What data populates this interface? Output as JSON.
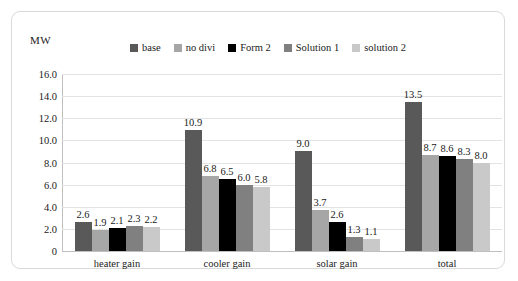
{
  "chart_data": {
    "type": "bar",
    "title": "",
    "subtitle": "",
    "xlabel": "",
    "ylabel": "MW",
    "categories": [
      "heater gain",
      "cooler gain",
      "solar gain",
      "total"
    ],
    "series": [
      {
        "name": "base",
        "color": "#595959",
        "values": [
          2.6,
          10.9,
          9.0,
          13.5
        ],
        "labels": [
          "2.6",
          "10.9",
          "9.0",
          "13.5"
        ]
      },
      {
        "name": "no divi",
        "color": "#a6a6a6",
        "values": [
          1.9,
          6.8,
          3.7,
          8.7
        ],
        "labels": [
          "1.9",
          "6.8",
          "3.7",
          "8.7"
        ]
      },
      {
        "name": "Form 2",
        "color": "#000000",
        "values": [
          2.1,
          6.5,
          2.6,
          8.6
        ],
        "labels": [
          "2.1",
          "6.5",
          "2.6",
          "8.6"
        ]
      },
      {
        "name": "Solution 1",
        "color": "#808080",
        "values": [
          2.3,
          6.0,
          1.3,
          8.3
        ],
        "labels": [
          "2.3",
          "6.0",
          "1.3",
          "8.3"
        ]
      },
      {
        "name": "solution 2",
        "color": "#c9c9c9",
        "values": [
          2.2,
          5.8,
          1.1,
          8.0
        ],
        "labels": [
          "2.2",
          "5.8",
          "1.1",
          "8.0"
        ]
      }
    ],
    "ylim": [
      0,
      16
    ],
    "ytick_values": [
      16,
      14,
      12,
      10,
      8,
      6,
      4,
      2,
      0
    ],
    "ytick_labels": [
      "16.0",
      "14.0",
      "12.0",
      "10.0",
      "8.0",
      "6.0",
      "4.0",
      "2.0",
      "0"
    ],
    "grid": true,
    "legend_position": "top"
  },
  "frame": {
    "border_color": "#d9d9d9",
    "background": "#ffffff"
  }
}
